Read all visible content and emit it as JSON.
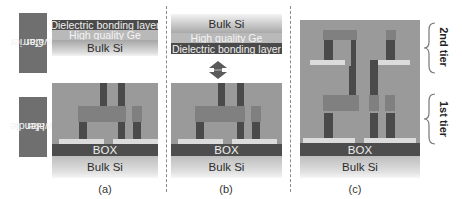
{
  "figure": {
    "side_labels": {
      "carrier": "Carrier\nwafer",
      "carrier_line1": "Carrier",
      "carrier_line2": "wafer",
      "handle_line1": "Handle",
      "handle_line2": "wafer"
    },
    "layers": {
      "dielectric": "Dielectric bonding layer",
      "ge": "High quality Ge",
      "bulk_si": "Bulk Si",
      "box": "BOX"
    },
    "panels": [
      {
        "caption": "(a)"
      },
      {
        "caption": "(b)"
      },
      {
        "caption": "(c)"
      }
    ],
    "tiers": {
      "second": "2nd tier",
      "first": "1st tier"
    },
    "icons": {
      "bond_arrow": "double-headed-vertical-arrow",
      "tier_brace": "curly-brace-right"
    },
    "colors": {
      "dark_layer": "#4a4a4a",
      "device_gray": "#9a9a9a",
      "label_box": "#6f6f6f",
      "strip": "#dcdcdc"
    }
  }
}
